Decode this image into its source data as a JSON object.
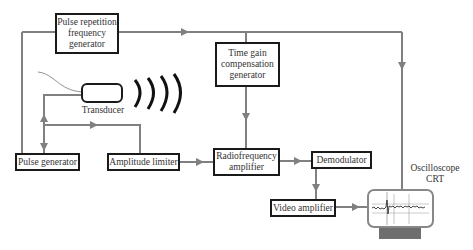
{
  "diagram": {
    "type": "block-diagram",
    "colors": {
      "line": "#808080",
      "box_border": "#1a1a1a",
      "text": "#333333",
      "crt_base": "#6e6e6e"
    },
    "blocks": {
      "prf_generator": "Pulse repetition\nfrequency\ngenerator",
      "tgc_generator": "Time gain\ncompensation\ngenerator",
      "pulse_generator": "Pulse generator",
      "amplitude_limiter": "Amplitude limiter",
      "rf_amplifier": "Radiofrequency\namplifier",
      "demodulator": "Demodulator",
      "video_amplifier": "Video amplifier"
    },
    "labels": {
      "transducer": "Transducer",
      "oscilloscope": "Oscilloscope\nCRT"
    },
    "connections": [
      {
        "from": "Pulse repetition frequency generator",
        "to": "Time gain compensation generator"
      },
      {
        "from": "Pulse repetition frequency generator",
        "to": "Oscilloscope CRT"
      },
      {
        "from": "Pulse repetition frequency generator",
        "to": "Pulse generator"
      },
      {
        "from": "Pulse generator",
        "to": "Transducer"
      },
      {
        "from": "Transducer",
        "to": "Amplitude limiter"
      },
      {
        "from": "Amplitude limiter",
        "to": "Radiofrequency amplifier"
      },
      {
        "from": "Time gain compensation generator",
        "to": "Radiofrequency amplifier"
      },
      {
        "from": "Radiofrequency amplifier",
        "to": "Demodulator"
      },
      {
        "from": "Demodulator",
        "to": "Video amplifier"
      },
      {
        "from": "Video amplifier",
        "to": "Oscilloscope CRT"
      }
    ]
  }
}
